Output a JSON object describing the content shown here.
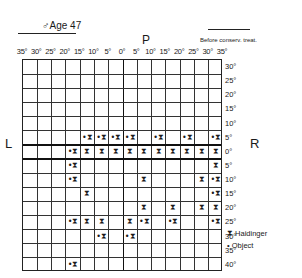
{
  "header": {
    "title": "♂Age 47",
    "subtitle": "Before conserv. treat.",
    "top_axis_label": "P",
    "left_axis_label": "L",
    "right_axis_label": "R"
  },
  "chart_data": {
    "type": "table",
    "columns": [
      "35°",
      "30°",
      "25°",
      "20°",
      "15°",
      "10°",
      "5°",
      "0°",
      "5°",
      "10°",
      "15°",
      "20°",
      "25°",
      "30°",
      "35°"
    ],
    "rows": [
      "30°",
      "25°",
      "20°",
      "15°",
      "10°",
      "5°",
      "0°",
      "5°",
      "10°",
      "15°",
      "20°",
      "25°",
      "30°",
      "35°",
      "40°"
    ],
    "grid_cols": 14,
    "grid_rows": 15,
    "marks": [
      {
        "row": 5,
        "col": 4,
        "type": "object+haidinger"
      },
      {
        "row": 5,
        "col": 5,
        "type": "object+haidinger"
      },
      {
        "row": 5,
        "col": 6,
        "type": "object+haidinger"
      },
      {
        "row": 5,
        "col": 7,
        "type": "object+haidinger"
      },
      {
        "row": 5,
        "col": 9,
        "type": "object+haidinger"
      },
      {
        "row": 5,
        "col": 11,
        "type": "object+haidinger"
      },
      {
        "row": 5,
        "col": 13,
        "type": "object+haidinger"
      },
      {
        "row": 6,
        "col": 3,
        "type": "object+haidinger"
      },
      {
        "row": 6,
        "col": 4,
        "type": "haidinger"
      },
      {
        "row": 6,
        "col": 5,
        "type": "haidinger"
      },
      {
        "row": 6,
        "col": 6,
        "type": "haidinger"
      },
      {
        "row": 6,
        "col": 7,
        "type": "haidinger"
      },
      {
        "row": 6,
        "col": 8,
        "type": "haidinger"
      },
      {
        "row": 6,
        "col": 9,
        "type": "haidinger"
      },
      {
        "row": 6,
        "col": 10,
        "type": "haidinger"
      },
      {
        "row": 6,
        "col": 11,
        "type": "haidinger"
      },
      {
        "row": 6,
        "col": 12,
        "type": "haidinger"
      },
      {
        "row": 6,
        "col": 13,
        "type": "haidinger"
      },
      {
        "row": 7,
        "col": 3,
        "type": "object+haidinger"
      },
      {
        "row": 7,
        "col": 13,
        "type": "haidinger"
      },
      {
        "row": 8,
        "col": 3,
        "type": "object+haidinger"
      },
      {
        "row": 8,
        "col": 8,
        "type": "haidinger"
      },
      {
        "row": 8,
        "col": 12,
        "type": "haidinger"
      },
      {
        "row": 8,
        "col": 13,
        "type": "object+haidinger"
      },
      {
        "row": 9,
        "col": 4,
        "type": "haidinger"
      },
      {
        "row": 9,
        "col": 13,
        "type": "object+haidinger"
      },
      {
        "row": 10,
        "col": 8,
        "type": "haidinger"
      },
      {
        "row": 10,
        "col": 10,
        "type": "haidinger"
      },
      {
        "row": 10,
        "col": 12,
        "type": "haidinger"
      },
      {
        "row": 10,
        "col": 13,
        "type": "haidinger"
      },
      {
        "row": 11,
        "col": 3,
        "type": "object+haidinger"
      },
      {
        "row": 11,
        "col": 4,
        "type": "haidinger"
      },
      {
        "row": 11,
        "col": 5,
        "type": "haidinger"
      },
      {
        "row": 11,
        "col": 7,
        "type": "haidinger"
      },
      {
        "row": 11,
        "col": 8,
        "type": "object+haidinger"
      },
      {
        "row": 11,
        "col": 10,
        "type": "object+haidinger"
      },
      {
        "row": 11,
        "col": 13,
        "type": "object+haidinger"
      },
      {
        "row": 12,
        "col": 5,
        "type": "object+haidinger"
      },
      {
        "row": 12,
        "col": 7,
        "type": "object+haidinger"
      },
      {
        "row": 14,
        "col": 3,
        "type": "object+haidinger"
      }
    ],
    "legend": [
      {
        "symbol": "⧗",
        "label": "Haidinger"
      },
      {
        "symbol": "•",
        "label": "Object"
      }
    ]
  },
  "legend": {
    "haidinger_symbol": "⧗",
    "haidinger_label": "Haidinger",
    "object_symbol": "•",
    "object_label": "Object"
  }
}
